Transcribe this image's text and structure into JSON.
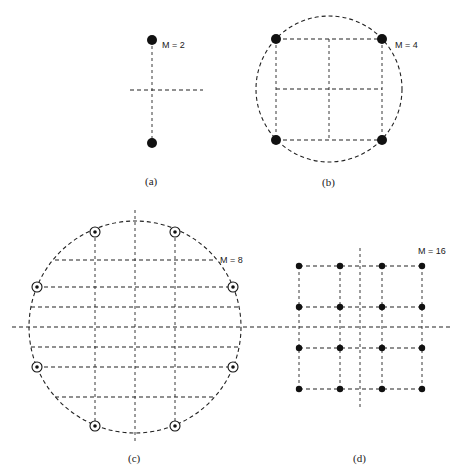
{
  "figure": {
    "panels": [
      {
        "id": "a",
        "caption": "(a)",
        "label": "M = 2",
        "points": [
          [
            152,
            40
          ],
          [
            152,
            143
          ]
        ]
      },
      {
        "id": "b",
        "caption": "(b)",
        "label": "M = 4",
        "points": [
          [
            276,
            39
          ],
          [
            382,
            39
          ],
          [
            276,
            140
          ],
          [
            382,
            140
          ]
        ]
      },
      {
        "id": "c",
        "caption": "(c)",
        "label": "M = 8",
        "points": [
          [
            95,
            232
          ],
          [
            175,
            232
          ],
          [
            37,
            287
          ],
          [
            233,
            287
          ],
          [
            37,
            367
          ],
          [
            233,
            367
          ],
          [
            95,
            426
          ],
          [
            175,
            426
          ]
        ]
      },
      {
        "id": "d",
        "caption": "(d)",
        "label": "M = 16",
        "grid_x": [
          299,
          340,
          382,
          422
        ],
        "grid_y": [
          266,
          307,
          348,
          389
        ]
      }
    ]
  }
}
